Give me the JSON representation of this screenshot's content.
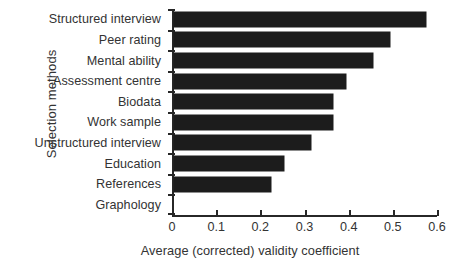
{
  "chart_data": {
    "type": "bar",
    "orientation": "horizontal",
    "title": "",
    "xlabel": "Average (corrected) validity coefficient",
    "ylabel": "Selection methods",
    "xlim": [
      0,
      0.6
    ],
    "xticks": [
      "0",
      "0.1",
      "0.2",
      "0.3",
      "0.4",
      "0.5",
      "0.6"
    ],
    "xtick_values": [
      0,
      0.1,
      0.2,
      0.3,
      0.4,
      0.5,
      0.6
    ],
    "grid": false,
    "legend": false,
    "bar_color": "#1c1c1c",
    "axis_color": "#272727",
    "text_color": "#333333",
    "categories": [
      "Structured interview",
      "Peer rating",
      "Mental ability",
      "Assessment centre",
      "Biodata",
      "Work sample",
      "Unstructured interview",
      "Education",
      "References",
      "Graphology"
    ],
    "values": [
      0.57,
      0.49,
      0.45,
      0.39,
      0.36,
      0.36,
      0.31,
      0.25,
      0.22,
      0.0
    ]
  },
  "caption": {
    "text": ""
  }
}
